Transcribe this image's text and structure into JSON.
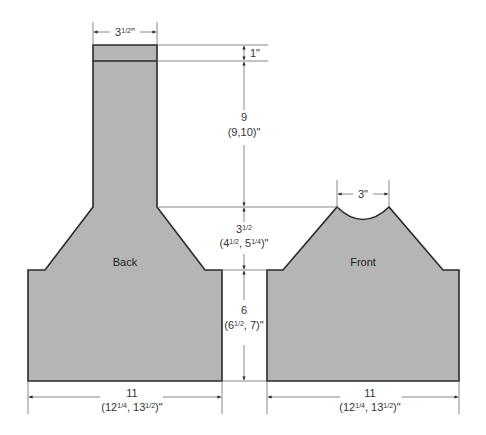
{
  "diagram": {
    "type": "knitting-schematic",
    "pieces": [
      {
        "name": "back",
        "label": "Back"
      },
      {
        "name": "front",
        "label": "Front"
      }
    ],
    "dimensions": {
      "back_neck_width": {
        "whole": "3",
        "frac": "1/2",
        "unit": "\""
      },
      "collar_band": {
        "text": "1\""
      },
      "collar_height": {
        "line1": "9",
        "line2": "(9,10)\""
      },
      "armhole_depth": {
        "line1_whole": "3",
        "line1_frac": "1/2",
        "line2": "(4",
        "line2_frac_a": "1/2",
        "line2_mid": ", 5",
        "line2_frac_b": "1/4",
        "line2_end": ")\""
      },
      "side_length": {
        "line1": "6",
        "line2_start": "(6",
        "line2_frac": "1/2",
        "line2_end": ", 7)\""
      },
      "back_width": {
        "line1": "11",
        "line2_start": "(12",
        "line2_frac_a": "1/4",
        "line2_mid": ", 13",
        "line2_frac_b": "1/2",
        "line2_end": ")\""
      },
      "front_neck_width": {
        "text": "3\""
      },
      "front_width": {
        "line1": "11",
        "line2_start": "(12",
        "line2_frac_a": "1/4",
        "line2_mid": ", 13",
        "line2_frac_b": "1/2",
        "line2_end": ")\""
      }
    },
    "colors": {
      "fill": "#b5b5b5",
      "outline": "#2a2a2a",
      "dimension_line": "#6a6a6a"
    }
  }
}
